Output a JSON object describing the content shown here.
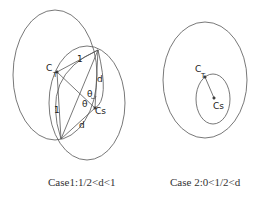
{
  "case1": {
    "caption": "Case1:1/2<d<1",
    "labels": {
      "ct": "C",
      "ct_sub": "T",
      "cs": "Cs",
      "one_top": "1",
      "one_left": "1",
      "d_right": "d",
      "d_bottom": "d",
      "theta1": "θ",
      "theta2": "θ"
    }
  },
  "case2": {
    "caption": "Case 2:0<1/2<d",
    "labels": {
      "ct": "C",
      "ct_sub": "T",
      "cs": "Cs"
    }
  }
}
